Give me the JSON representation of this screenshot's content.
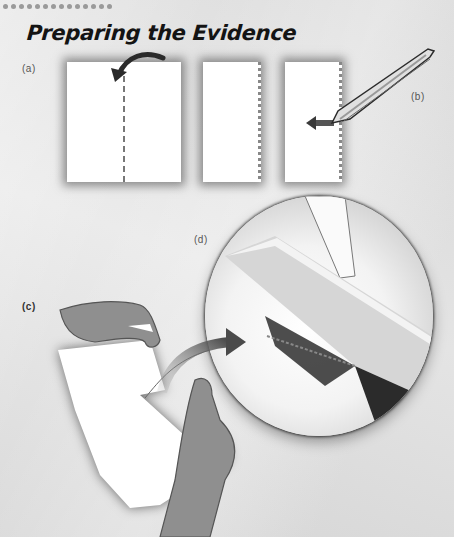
{
  "header": {
    "dot_count": 14,
    "title": "Preparing the Evidence"
  },
  "labels": {
    "a": "(a)",
    "b": "(b)",
    "c": "(c)",
    "d": "(d)"
  },
  "icons": {
    "fold_arrow": "curved-arrow-icon",
    "pull_arrow": "left-arrow-icon",
    "tweezers": "tweezers-icon",
    "magnify_arrow": "curved-arrow-icon",
    "magnifier": "magnifier-icon"
  },
  "colors": {
    "background": "#e6e6e6",
    "paper": "#ffffff",
    "hand": "#8f8f8f",
    "arrow": "#555555",
    "title": "#141414"
  }
}
